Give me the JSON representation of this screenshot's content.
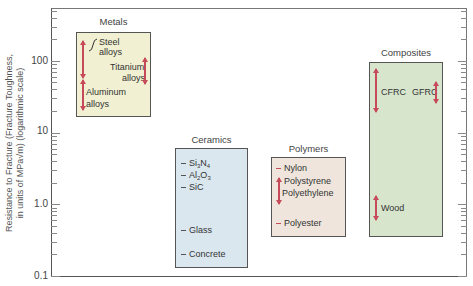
{
  "chart_data": {
    "type": "range-bar",
    "title": "",
    "xlabel": "",
    "ylabel": "Resistance to Fracture (Fracture Toughness, in units of MPa√m) (logarithmic scale)",
    "yscale": "log",
    "ylim": [
      0.1,
      500
    ],
    "yticks": [
      "100",
      "10",
      "1.0",
      "0.1"
    ],
    "grid": false,
    "categories": [
      "Metals",
      "Ceramics",
      "Polymers",
      "Composites"
    ],
    "ranges": [
      {
        "category": "Metals",
        "min": 18,
        "max": 300
      },
      {
        "category": "Ceramics",
        "min": 0.14,
        "max": 6
      },
      {
        "category": "Polymers",
        "min": 0.35,
        "max": 4.5
      },
      {
        "category": "Composites",
        "min": 0.38,
        "max": 95
      }
    ],
    "materials": [
      {
        "category": "Metals",
        "name": "Steel alloys",
        "min": 50,
        "max": 200
      },
      {
        "category": "Metals",
        "name": "Titanium alloys",
        "min": 44,
        "max": 110
      },
      {
        "category": "Metals",
        "name": "Aluminum alloys",
        "min": 20,
        "max": 45
      },
      {
        "category": "Ceramics",
        "name": "Si3N4",
        "value": 5
      },
      {
        "category": "Ceramics",
        "name": "Al2O3",
        "value": 4
      },
      {
        "category": "Ceramics",
        "name": "SiC",
        "value": 3
      },
      {
        "category": "Ceramics",
        "name": "Glass",
        "value": 0.7
      },
      {
        "category": "Ceramics",
        "name": "Concrete",
        "value": 0.2
      },
      {
        "category": "Polymers",
        "name": "Nylon",
        "value": 3
      },
      {
        "category": "Polymers",
        "name": "Polystyrene",
        "min": 0.7,
        "max": 2
      },
      {
        "category": "Polymers",
        "name": "Polyethylene",
        "min": 1,
        "max": 2
      },
      {
        "category": "Polymers",
        "name": "Polyester",
        "value": 0.5
      },
      {
        "category": "Composites",
        "name": "CFRC",
        "min": 30,
        "max": 75
      },
      {
        "category": "Composites",
        "name": "GFRC",
        "min": 20,
        "max": 40
      },
      {
        "category": "Composites",
        "name": "Wood",
        "min": 0.4,
        "max": 1
      }
    ],
    "colors": {
      "Metals": "#f1f0d2",
      "Ceramics": "#dbe7ef",
      "Polymers": "#efe5dc",
      "Composites": "#d7e5cd",
      "range_arrow": "#c64a5a"
    }
  },
  "axis": {
    "ylabel_line1": "Resistance to Fracture (Fracture Toughness,",
    "ylabel_line2": "in units of MPa√m) (logarithmic scale)",
    "ticks": [
      "100",
      "10",
      "1.0",
      "0.1"
    ]
  },
  "groups": {
    "metals": {
      "title": "Metals",
      "items": [
        "Steel",
        "alloys",
        "Titanium",
        "alloys",
        "Aluminum",
        "alloys"
      ]
    },
    "ceramics": {
      "title": "Ceramics",
      "items": [
        "Si",
        "3",
        "N",
        "4",
        "Al",
        "2",
        "O",
        "3",
        "SiC",
        "Glass",
        "Concrete"
      ]
    },
    "polymers": {
      "title": "Polymers",
      "items": [
        "Nylon",
        "Polystyrene",
        "Polyethylene",
        "Polyester"
      ]
    },
    "composites": {
      "title": "Composites",
      "items": [
        "CFRC",
        "GFRC",
        "Wood"
      ]
    }
  }
}
